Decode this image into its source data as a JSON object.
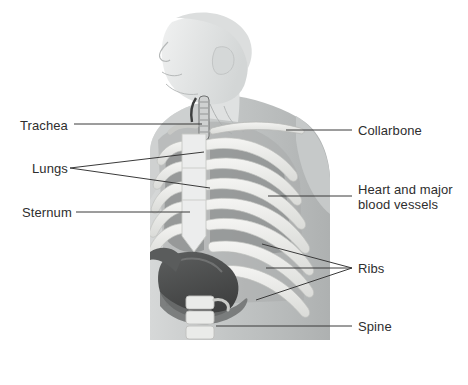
{
  "figure": {
    "background_color": "#ffffff",
    "line_color": "#3a3a3a",
    "text_color": "#2e2e2e",
    "palette": {
      "skin_light": "#e9eaea",
      "skin_mid": "#cfd2d2",
      "body_gray": "#b9bcbc",
      "bone_light": "#f1f1ef",
      "bone_shade": "#d8d9d6",
      "cavity_gray": "#9a9d9d",
      "lung_gray": "#8f9292",
      "heart_dark": "#4a4a4a",
      "heart_mid": "#6e7070"
    }
  },
  "labels": {
    "left": [
      {
        "id": "trachea",
        "text": "Trachea",
        "x": 20,
        "y": 118,
        "leader": "single"
      },
      {
        "id": "lungs",
        "text": "Lungs",
        "x": 32,
        "y": 164,
        "leader": "fork-2"
      },
      {
        "id": "sternum",
        "text": "Sternum",
        "x": 22,
        "y": 206,
        "leader": "single"
      }
    ],
    "right": [
      {
        "id": "collarbone",
        "text": "Collarbone",
        "x": 358,
        "y": 124,
        "leader": "single"
      },
      {
        "id": "heart",
        "text": "Heart and major\nblood vessels",
        "x": 358,
        "y": 186,
        "leader": "single"
      },
      {
        "id": "ribs",
        "text": "Ribs",
        "x": 358,
        "y": 262,
        "leader": "fork-3"
      },
      {
        "id": "spine",
        "text": "Spine",
        "x": 358,
        "y": 320,
        "leader": "single"
      }
    ]
  }
}
